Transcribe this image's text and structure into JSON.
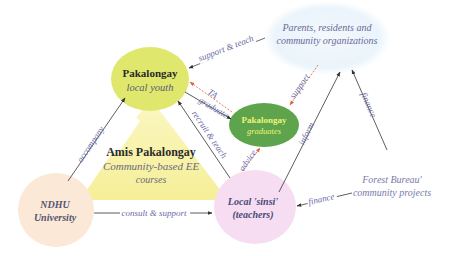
{
  "diagram": {
    "colors": {
      "youth_fill": "#dfe86c",
      "parents_fill": "#eef6fc",
      "graduates_fill": "#5ea44c",
      "triangle_fill": "#f7f2a0",
      "ndhu_fill": "#fbe8d6",
      "sinsi_fill": "#f6ddf1",
      "arrow_dark": "#333333",
      "arrow_red": "#e2603c",
      "edge_label": "#6a6aa8"
    },
    "nodes": {
      "youth": {
        "title": "Pakalongay",
        "subtitle": "local youth"
      },
      "parents": {
        "line1": "Parents, residents and",
        "line2": "community organizations"
      },
      "graduates": {
        "title": "Pakalongay",
        "subtitle": "graduates"
      },
      "course": {
        "title": "Amis Pakalongay",
        "line1": "Community-based EE",
        "line2": "courses"
      },
      "ndhu": {
        "line1": "NDHU",
        "line2": "University"
      },
      "sinsi": {
        "line1": "Local 'sinsi'",
        "line2": "(teachers)"
      },
      "forest": {
        "line1": "Forest Bureau'",
        "line2": "community projects"
      }
    },
    "edges": {
      "support_teach": "support & teach",
      "ta": "TA",
      "graduate": "graduate",
      "support": "support",
      "accompany": "accompany",
      "recruit_teach": "recruit & teach",
      "advice": "advice",
      "inform": "inform",
      "finance_parents": "finance",
      "finance_sinsi": "finance",
      "consult_support": "consult & support"
    }
  }
}
